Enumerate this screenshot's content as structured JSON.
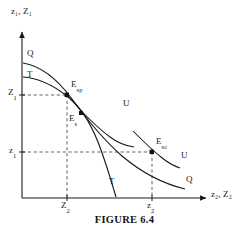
{
  "figure": {
    "caption": "FIGURE 6.4",
    "caption_y": 215,
    "background_color": "#ffffff",
    "line_color": "#1a1a1a",
    "dash_color": "#555555"
  },
  "axes": {
    "origin": {
      "x": 22,
      "y": 198
    },
    "x_axis": {
      "label": "z",
      "label_sub": "2",
      "label2": ", Z",
      "label2_sub": "2",
      "label_full": "z₂, Z₂",
      "label_x": 212,
      "label_y": 194,
      "start_x": 22,
      "end_x": 208,
      "y": 198,
      "arrow": true
    },
    "y_axis": {
      "label": "z",
      "label_sub": "1",
      "label2": ", Z",
      "label2_sub": "1",
      "label_full": "z₁, Z₁",
      "label_x": 11,
      "label_y": 8,
      "start_y": 198,
      "end_y": 30,
      "x": 22,
      "arrow": true
    }
  },
  "ticks": {
    "y": [
      {
        "name": "Z1",
        "text": "Z",
        "sub": "1",
        "value_y": 95,
        "label_x": 8,
        "label_y": 89
      },
      {
        "name": "z1",
        "text": "z",
        "sub": "1",
        "value_y": 152,
        "label_x": 9,
        "label_y": 146
      }
    ],
    "x": [
      {
        "name": "Z2",
        "text": "Z",
        "sub": "2",
        "value_x": 67,
        "label_x": 60,
        "label_y": 201
      },
      {
        "name": "z2",
        "text": "z",
        "sub": "2",
        "value_x": 152,
        "label_x": 146,
        "label_y": 201
      }
    ]
  },
  "curves": [
    {
      "name": "Q-curve",
      "label": "Q",
      "role": "quasi-transformation-curve",
      "label_start": {
        "text": "Q",
        "x": 28,
        "y": 55
      },
      "label_end": {
        "text": "Q",
        "x": 188,
        "y": 180
      },
      "path": "M 23,63 C 55,73 95,110 130,140 C 155,161 172,178 184,188"
    },
    {
      "name": "T-curve",
      "label": "T",
      "role": "transformation-curve",
      "label_start": {
        "text": "T",
        "x": 28,
        "y": 75
      },
      "label_end": {
        "text": "T",
        "x": 110,
        "y": 180
      },
      "path": "M 23,77 C 45,80 72,95 90,120 C 103,139 112,168 118,196"
    },
    {
      "name": "U-curve-upper",
      "label": "U",
      "role": "indifference-curve-upper",
      "label_end": {
        "text": "U",
        "x": 124,
        "y": 103
      },
      "path": "M 67,95 C 85,113 105,130 122,140 C 130,145 136,148 141,149"
    },
    {
      "name": "U-curve-lower",
      "label": "U",
      "role": "indifference-curve-lower",
      "label_end": {
        "text": "U",
        "x": 182,
        "y": 155
      },
      "path": "M 134,132 C 146,142 158,152 167,159 C 173,164 177,167 180,169"
    }
  ],
  "points": [
    {
      "name": "E_sp",
      "text": "E",
      "sub": "sp",
      "x": 67,
      "y": 95,
      "label_x": 72,
      "label_y": 83,
      "description": "social-planner-equilibrium"
    },
    {
      "name": "E_s",
      "text": "E",
      "sub": "s",
      "x": 81,
      "y": 114,
      "label_x": 70,
      "label_y": 117,
      "description": "second-best-equilibrium"
    },
    {
      "name": "E_sc",
      "text": "E",
      "sub": "sc",
      "x": 152,
      "y": 152,
      "label_x": 157,
      "label_y": 140,
      "description": "competitive-equilibrium"
    }
  ],
  "guides": [
    {
      "name": "guide-Esp-horizontal",
      "x1": 22,
      "y1": 95,
      "x2": 67,
      "y2": 95
    },
    {
      "name": "guide-Esp-vertical",
      "x1": 67,
      "y1": 95,
      "x2": 67,
      "y2": 198
    },
    {
      "name": "guide-Esc-horizontal",
      "x1": 22,
      "y1": 152,
      "x2": 152,
      "y2": 152
    },
    {
      "name": "guide-Esc-vertical",
      "x1": 152,
      "y1": 152,
      "x2": 152,
      "y2": 198
    }
  ]
}
